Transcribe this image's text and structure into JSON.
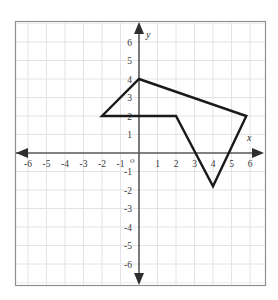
{
  "figure": {
    "origin_label": "o",
    "x_axis_name": "x",
    "y_axis_name": "y"
  },
  "chart_data": {
    "type": "line",
    "title": "",
    "xlabel": "x",
    "ylabel": "y",
    "xlim": [
      -6.6,
      6.6
    ],
    "ylim": [
      -6.6,
      6.6
    ],
    "grid": true,
    "grid_step": 1,
    "legend": "none",
    "x_ticks": [
      -6,
      -5,
      -4,
      -3,
      -2,
      -1,
      1,
      2,
      3,
      4,
      5,
      6
    ],
    "y_ticks": [
      6,
      5,
      4,
      3,
      2,
      1,
      -1,
      -2,
      -3,
      -4,
      -5,
      -6
    ],
    "x_tick_labels": [
      "-6",
      "-5",
      "-4",
      "-3",
      "-2",
      "-1",
      "1",
      "2",
      "3",
      "4",
      "5",
      "6"
    ],
    "y_tick_labels": [
      "6",
      "5",
      "4",
      "3",
      "2",
      "1",
      "-1",
      "-2",
      "-3",
      "-4",
      "-5",
      "-6"
    ],
    "series": [
      {
        "name": "polygon",
        "closed": true,
        "points": [
          {
            "x": 0,
            "y": 4
          },
          {
            "x": 5.8,
            "y": 2
          },
          {
            "x": 4,
            "y": -1.8
          },
          {
            "x": 2,
            "y": 2
          },
          {
            "x": -2,
            "y": 2
          }
        ]
      }
    ],
    "colors": {
      "polygon_stroke": "#1a1a1a",
      "axis": "#58585c",
      "grid": "#e4e4e8",
      "frame": "#8f8f95",
      "background": "#ffffff"
    }
  }
}
